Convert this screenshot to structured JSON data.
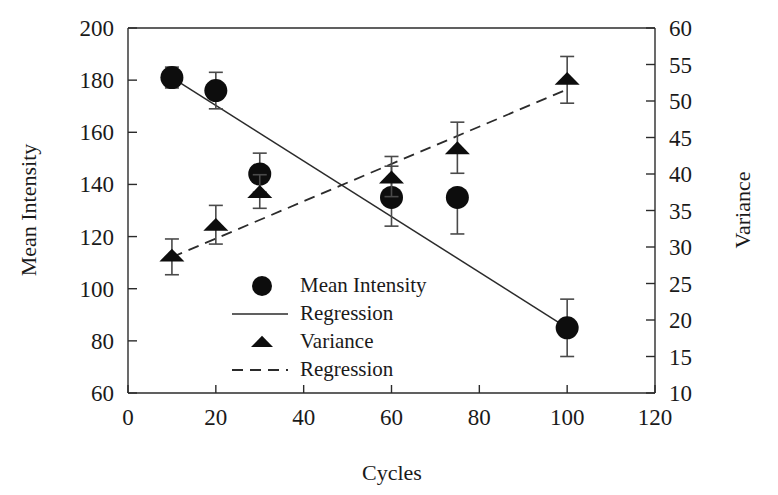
{
  "chart_data": {
    "type": "scatter",
    "title": "",
    "xlabel": "Cycles",
    "ylabel": "Mean Intensity",
    "y2label": "Variance",
    "xlim": [
      0,
      120
    ],
    "ylim": [
      60,
      200
    ],
    "y2lim": [
      10,
      60
    ],
    "xticks": [
      "0",
      "20",
      "40",
      "60",
      "80",
      "100",
      "120"
    ],
    "yticks": [
      "60",
      "80",
      "100",
      "120",
      "140",
      "160",
      "180",
      "200"
    ],
    "y2ticks": [
      "10",
      "15",
      "20",
      "25",
      "30",
      "35",
      "40",
      "45",
      "50",
      "55",
      "60"
    ],
    "grid": false,
    "legend_position": "lower-center-left",
    "marker_color": "#0d0d0d",
    "series": [
      {
        "name": "Mean Intensity",
        "marker": "circle",
        "axis": "left",
        "x": [
          10,
          20,
          30,
          60,
          75,
          100
        ],
        "values": [
          181,
          176,
          144,
          135,
          135,
          85
        ],
        "err_low": [
          4,
          7,
          7,
          11,
          14,
          11
        ],
        "err_high": [
          4,
          7,
          8,
          12,
          0,
          11
        ]
      },
      {
        "name": "Variance",
        "marker": "triangle",
        "axis": "right",
        "x": [
          10,
          20,
          30,
          60,
          75,
          100
        ],
        "values": [
          28.8,
          33.0,
          37.5,
          39.5,
          43.5,
          53.0
        ],
        "err_low": [
          2.6,
          2.6,
          2.2,
          2.6,
          3.4,
          3.3
        ],
        "err_high": [
          2.3,
          2.7,
          2.4,
          2.9,
          3.6,
          3.1
        ]
      },
      {
        "name": "Regression",
        "marker": "line-solid",
        "axis": "left",
        "x": [
          10,
          100
        ],
        "values": [
          181,
          85
        ]
      },
      {
        "name": "Regression",
        "marker": "line-dashed",
        "axis": "right",
        "x": [
          10,
          100
        ],
        "values": [
          28.6,
          51.6
        ]
      }
    ]
  },
  "legend": {
    "items": [
      {
        "label": "Mean Intensity",
        "glyph": "circle-marker"
      },
      {
        "label": "Regression",
        "glyph": "solid-line-swatch"
      },
      {
        "label": "Variance",
        "glyph": "triangle-marker"
      },
      {
        "label": "Regression",
        "glyph": "dashed-line-swatch"
      }
    ]
  }
}
